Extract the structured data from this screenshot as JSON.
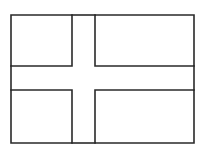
{
  "figure": {
    "type": "nordic-cross-flag-outline",
    "stroke_color": "#2a2a2a",
    "background": "#ffffff",
    "outer": {
      "x1": 11,
      "y1": 15,
      "x2": 194,
      "y2": 143
    },
    "cross": {
      "vertical_left": 72,
      "vertical_right": 95,
      "horizontal_top": 66,
      "horizontal_bottom": 90
    }
  }
}
